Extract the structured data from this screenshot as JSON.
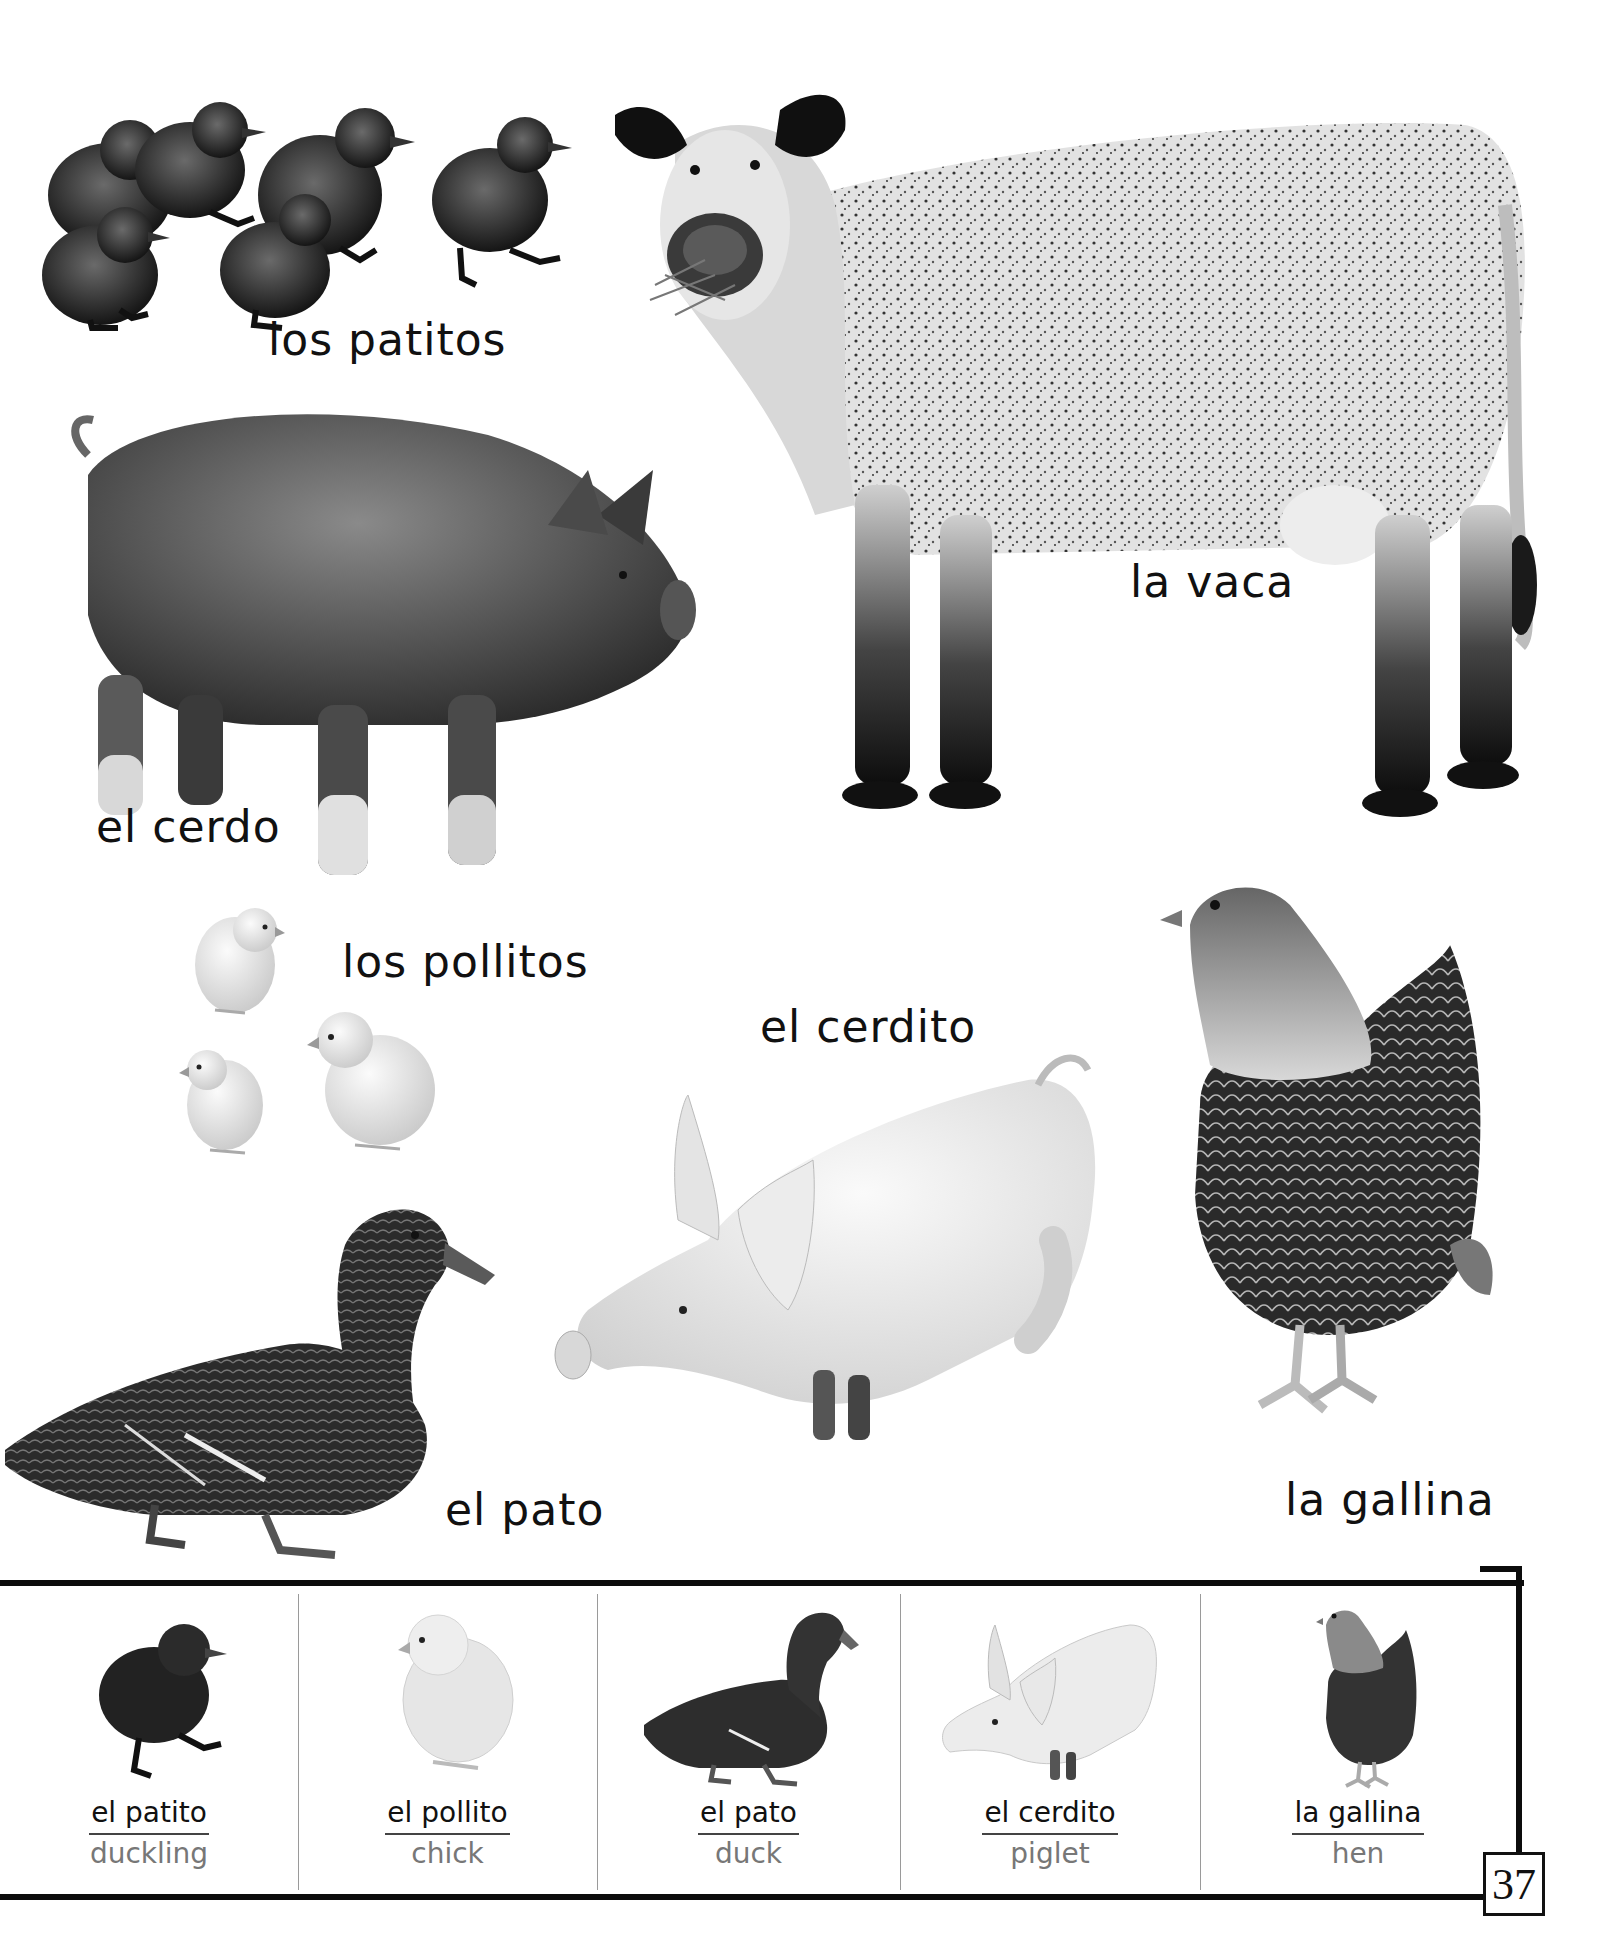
{
  "page": {
    "page_number": "37",
    "background": "#ffffff",
    "ink": "#111111",
    "secondary_ink": "#777777"
  },
  "scene": {
    "labels": {
      "ducklings": "los patitos",
      "cow": "la vaca",
      "pig": "el cerdo",
      "chicks": "los pollitos",
      "piglet": "el cerdito",
      "duck": "el pato",
      "hen": "la gallina"
    },
    "animals": [
      {
        "id": "ducklings",
        "icon": "ducklings-icon",
        "count": 5
      },
      {
        "id": "cow",
        "icon": "cow-icon"
      },
      {
        "id": "pig",
        "icon": "pig-icon"
      },
      {
        "id": "chicks",
        "icon": "chick-icon",
        "count": 3
      },
      {
        "id": "piglet",
        "icon": "piglet-icon"
      },
      {
        "id": "duck",
        "icon": "duck-icon"
      },
      {
        "id": "hen",
        "icon": "hen-icon"
      }
    ]
  },
  "vocabulary": [
    {
      "spanish": "el patito",
      "english": "duckling",
      "icon": "duckling-icon"
    },
    {
      "spanish": "el pollito",
      "english": "chick",
      "icon": "chick-icon"
    },
    {
      "spanish": "el pato",
      "english": "duck",
      "icon": "duck-icon"
    },
    {
      "spanish": "el cerdito",
      "english": "piglet",
      "icon": "piglet-icon"
    },
    {
      "spanish": "la gallina",
      "english": "hen",
      "icon": "hen-icon"
    }
  ]
}
